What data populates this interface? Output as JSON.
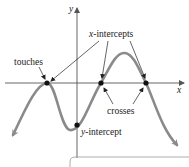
{
  "diagram": {
    "axes": {
      "x_label": "x",
      "y_label": "y"
    },
    "annotations": {
      "x_intercepts": {
        "var": "x",
        "text": "-intercepts"
      },
      "y_intercept": {
        "var": "y",
        "text": "-intercept"
      },
      "touches": "touches",
      "crosses": "crosses"
    },
    "points": [
      {
        "name": "touch-point",
        "role": "x-intercept (touches)"
      },
      {
        "name": "cross-point-1",
        "role": "x-intercept (crosses)"
      },
      {
        "name": "cross-point-2",
        "role": "x-intercept (crosses)"
      },
      {
        "name": "y-intercept-point",
        "role": "y-intercept"
      }
    ],
    "colors": {
      "curve": "#8a8a8a",
      "axis": "#555555",
      "text": "#222222",
      "point": "#111111"
    }
  }
}
